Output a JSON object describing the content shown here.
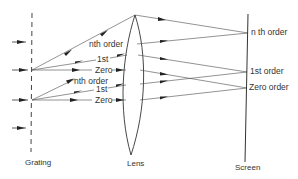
{
  "diagram": {
    "components": {
      "grating": {
        "label": "Grating"
      },
      "lens": {
        "label": "Lens"
      },
      "screen": {
        "label": "Screen"
      }
    },
    "ray_labels": {
      "upper_nth": "nth order",
      "upper_first": "1st",
      "upper_zero": "Zero",
      "lower_nth": "nth order",
      "lower_first": "1st",
      "lower_zero": "Zero"
    },
    "screen_labels": {
      "nth": "n th order",
      "first": "1st order",
      "zero": "Zero order"
    },
    "colors": {
      "line": "#4a4a4a",
      "text": "#333333",
      "background": "#ffffff"
    }
  }
}
